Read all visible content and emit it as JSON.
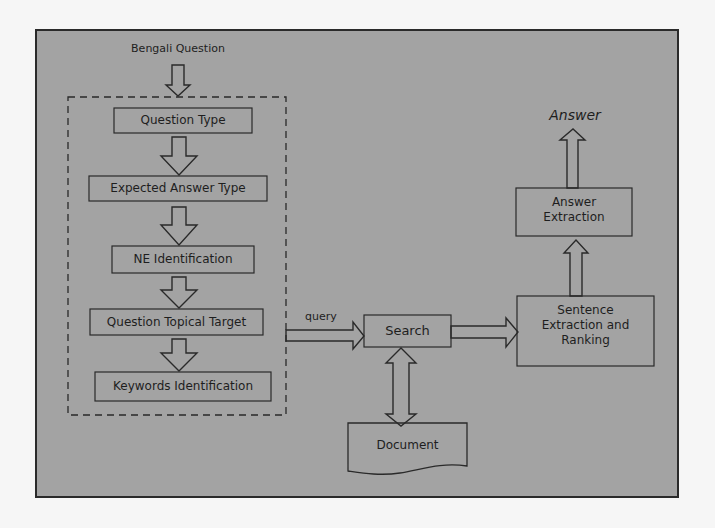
{
  "colors": {
    "page_bg": "#f6f6f6",
    "frame_bg": "#a3a3a3",
    "stroke": "#2a2a2a",
    "text": "#1e1e1e"
  },
  "diagram": {
    "input_label": "Bengali Question",
    "pipeline_steps": [
      {
        "label": "Question Type"
      },
      {
        "label": "Expected Answer Type"
      },
      {
        "label": "NE Identification"
      },
      {
        "label": "Question Topical Target"
      },
      {
        "label": "Keywords Identification"
      }
    ],
    "query_label": "query",
    "search_label": "Search",
    "document_label": "Document",
    "sentence_extraction_label_line1": "Sentence",
    "sentence_extraction_label_line2": "Extraction and",
    "sentence_extraction_label_line3": "Ranking",
    "answer_extraction_label_line1": "Answer",
    "answer_extraction_label_line2": "Extraction",
    "output_label": "Answer"
  }
}
